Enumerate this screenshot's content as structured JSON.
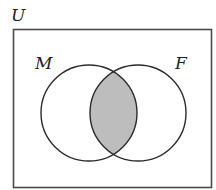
{
  "diagram": {
    "type": "venn",
    "universe_label": "U",
    "sets": [
      {
        "name": "left-set",
        "label": "M",
        "cx": 89,
        "cy": 113,
        "r": 48
      },
      {
        "name": "right-set",
        "label": "F",
        "cx": 138,
        "cy": 113,
        "r": 48
      }
    ],
    "shaded_region": "intersection",
    "colors": {
      "stroke": "#2b2b2b",
      "shade": "#bdbdbd",
      "background": "#ffffff"
    },
    "universe_box": {
      "x": 13.5,
      "y": 29.5,
      "width": 198,
      "height": 158
    }
  }
}
